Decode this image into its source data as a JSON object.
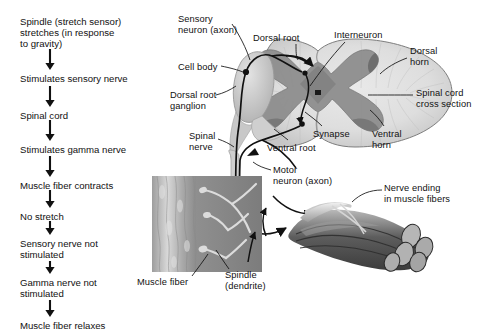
{
  "figure": {
    "background": "#ffffff",
    "ink": "#111111"
  },
  "flowchart": {
    "name": "stretch-reflex-flowchart",
    "arrow_x": 50,
    "steps": [
      {
        "id": "step-1",
        "text": "Spindle (stretch sensor)\nstretches (in response\nto gravity)",
        "x": 20,
        "y": 16
      },
      {
        "id": "step-2",
        "text": "Stimulates sensory nerve",
        "x": 20,
        "y": 73
      },
      {
        "id": "step-3",
        "text": "Spinal cord",
        "x": 20,
        "y": 110
      },
      {
        "id": "step-4",
        "text": "Stimulates gamma nerve",
        "x": 20,
        "y": 144
      },
      {
        "id": "step-5",
        "text": "Muscle fiber contracts",
        "x": 20,
        "y": 180
      },
      {
        "id": "step-6",
        "text": "No stretch",
        "x": 20,
        "y": 211
      },
      {
        "id": "step-7",
        "text": "Sensory nerve not\nstimulated",
        "x": 20,
        "y": 238
      },
      {
        "id": "step-8",
        "text": "Gamma nerve not\nstimulated",
        "x": 20,
        "y": 277
      },
      {
        "id": "step-9",
        "text": "Muscle fiber relaxes",
        "x": 20,
        "y": 320
      }
    ],
    "arrows": [
      {
        "id": "arrow-1",
        "x": 50,
        "y1": 49,
        "y2": 69
      },
      {
        "id": "arrow-2",
        "x": 50,
        "y1": 86,
        "y2": 106
      },
      {
        "id": "arrow-3",
        "x": 50,
        "y1": 120,
        "y2": 140
      },
      {
        "id": "arrow-4",
        "x": 50,
        "y1": 156,
        "y2": 176
      },
      {
        "id": "arrow-5",
        "x": 50,
        "y1": 190,
        "y2": 207
      },
      {
        "id": "arrow-6",
        "x": 50,
        "y1": 221,
        "y2": 234
      },
      {
        "id": "arrow-7",
        "x": 50,
        "y1": 261,
        "y2": 273
      },
      {
        "id": "arrow-8",
        "x": 50,
        "y1": 300,
        "y2": 316
      }
    ]
  },
  "diagram_labels": [
    {
      "id": "label-sensory-neuron-axon",
      "text": "Sensory\nneuron (axon)",
      "x": 178,
      "y": 14
    },
    {
      "id": "label-dorsal-root",
      "text": "Dorsal root",
      "x": 253,
      "y": 33
    },
    {
      "id": "label-interneuron",
      "text": "Interneuron",
      "x": 334,
      "y": 30
    },
    {
      "id": "label-dorsal-horn",
      "text": "Dorsal\nhorn",
      "x": 410,
      "y": 46
    },
    {
      "id": "label-cell-body",
      "text": "Cell body",
      "x": 178,
      "y": 62
    },
    {
      "id": "label-spinal-cord-cross-section",
      "text": "Spinal cord\ncross section",
      "x": 416,
      "y": 88
    },
    {
      "id": "label-dorsal-root-ganglion",
      "text": "Dorsal root\nganglion",
      "x": 170,
      "y": 90
    },
    {
      "id": "label-synapse",
      "text": "Synapse",
      "x": 313,
      "y": 129
    },
    {
      "id": "label-ventral-horn",
      "text": "Ventral\nhorn",
      "x": 372,
      "y": 129
    },
    {
      "id": "label-spinal-nerve",
      "text": "Spinal\nnerve",
      "x": 189,
      "y": 131
    },
    {
      "id": "label-ventral-root",
      "text": "Ventral root",
      "x": 267,
      "y": 143
    },
    {
      "id": "label-motor-neuron-axon",
      "text": "Motor\nneuron (axon)",
      "x": 273,
      "y": 165
    },
    {
      "id": "label-nerve-ending",
      "text": "Nerve ending\nin muscle fibers",
      "x": 384,
      "y": 183
    },
    {
      "id": "label-muscle-fiber",
      "text": "Muscle fiber",
      "x": 137,
      "y": 277
    },
    {
      "id": "label-spindle-dendrite",
      "text": "Spindle\n(dendrite)",
      "x": 225,
      "y": 270
    }
  ],
  "artwork": {
    "spinal_cord": {
      "name": "spinal-cord-cross-section",
      "white_matter_color": "#dcdcdc",
      "gray_matter_color": "#8e8e8e",
      "outline_color": "#6b6b6b",
      "cx": 355,
      "cy": 93,
      "rx": 97,
      "ry": 54
    },
    "dorsal_root_ganglion": {
      "name": "dorsal-root-ganglion",
      "fill": "#c9c9c9",
      "cx": 256,
      "cy": 84,
      "rx": 24,
      "ry": 33
    },
    "muscle_spindle": {
      "name": "muscle-spindle-illustration",
      "x": 152,
      "y": 176,
      "width": 110,
      "height": 96,
      "fiber_color": "#b4b4b4",
      "background_color": "#8a8a8a"
    },
    "nerve_ending_bundle": {
      "name": "muscle-fiber-bundle-illustration",
      "x": 290,
      "y": 205,
      "width": 150,
      "height": 70,
      "fiber_color": "#6f6f6f"
    },
    "neuron_path_color": "#111111"
  }
}
